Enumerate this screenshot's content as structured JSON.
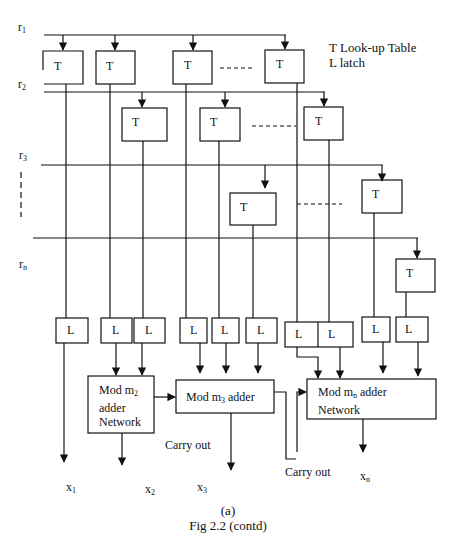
{
  "legend": {
    "line1": "T Look-up Table",
    "line2": "L latch"
  },
  "inputs": {
    "r1": {
      "base": "r",
      "sub": "1"
    },
    "r2": {
      "base": "r",
      "sub": "2"
    },
    "r3": {
      "base": "r",
      "sub": "3"
    },
    "rn": {
      "base": "r",
      "sub": "n"
    }
  },
  "lookup_table_label": "T",
  "latch_label": "L",
  "adders": {
    "m2": {
      "line1": "Mod m",
      "sub": "2",
      "line2": "adder",
      "line3": "Network"
    },
    "m3": {
      "line1": "Mod m",
      "sub": "3",
      "line1_suffix": " adder"
    },
    "mn": {
      "line1": "Mod m",
      "sub": "n",
      "line1_suffix": " adder",
      "line2": "Network"
    }
  },
  "carry_out_labels": [
    "Carry out",
    "Carry out"
  ],
  "outputs": {
    "x1": {
      "base": "x",
      "sub": "1"
    },
    "x2": {
      "base": "x",
      "sub": "2"
    },
    "x3": {
      "base": "x",
      "sub": "3"
    },
    "xn": {
      "base": "x",
      "sub": "n"
    }
  },
  "caption": {
    "panel": "(a)",
    "title": "Fig 2.2 (contd)"
  }
}
